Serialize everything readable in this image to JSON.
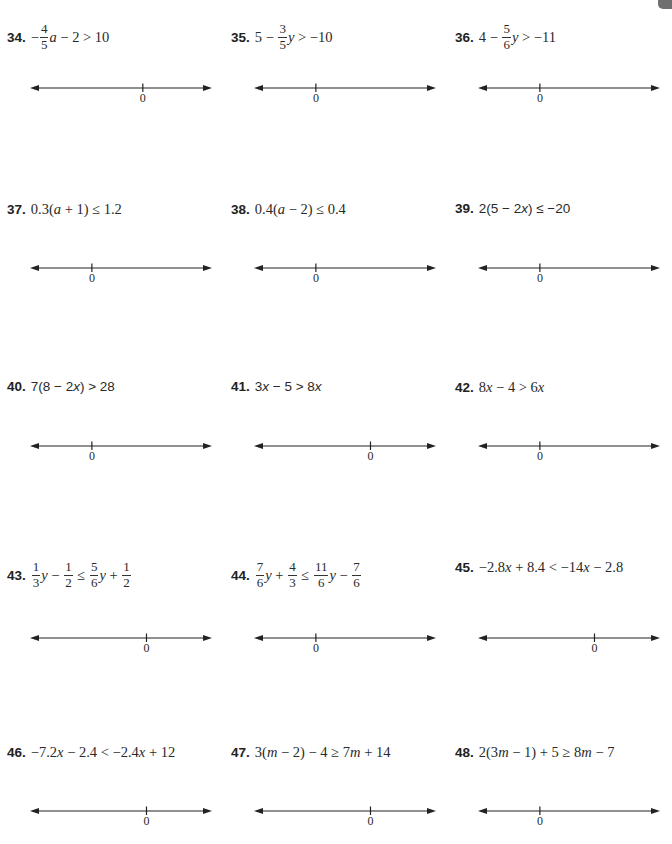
{
  "page": {
    "background": "#ffffff",
    "accent_tab_color": "#6f6f6f"
  },
  "problems": [
    {
      "number": "34.",
      "inequality": "−(4/5)a − 2 > 10",
      "parts": [
        [
          "op",
          "−"
        ],
        [
          "frac",
          "4",
          "5"
        ],
        [
          "var",
          "a"
        ],
        [
          "txt",
          " − 2 > 10"
        ]
      ],
      "zero_label": "0",
      "zero_position_pct": 62
    },
    {
      "number": "35.",
      "inequality": "5 − (3/5)y > −10",
      "parts": [
        [
          "txt",
          "5 − "
        ],
        [
          "frac",
          "3",
          "5"
        ],
        [
          "var",
          "y"
        ],
        [
          "txt",
          " > −10"
        ]
      ],
      "zero_label": "0",
      "zero_position_pct": 34
    },
    {
      "number": "36.",
      "inequality": "4 − (5/6)y > −11",
      "parts": [
        [
          "txt",
          "4 − "
        ],
        [
          "frac",
          "5",
          "6"
        ],
        [
          "var",
          "y"
        ],
        [
          "txt",
          " > −11"
        ]
      ],
      "zero_label": "0",
      "zero_position_pct": 34
    },
    {
      "number": "37.",
      "inequality": "0.3(a + 1) ≤ 1.2",
      "parts": [
        [
          "txt",
          "0.3("
        ],
        [
          "var",
          "a"
        ],
        [
          "txt",
          " + 1) ≤ 1.2"
        ]
      ],
      "zero_label": "0",
      "zero_position_pct": 34
    },
    {
      "number": "38.",
      "inequality": "0.4(a − 2) ≤ 0.4",
      "parts": [
        [
          "txt",
          "0.4("
        ],
        [
          "var",
          "a"
        ],
        [
          "txt",
          " − 2) ≤ 0.4"
        ]
      ],
      "zero_label": "0",
      "zero_position_pct": 34
    },
    {
      "number": "39.",
      "inequality": "2(5 − 2x) ≤ −20",
      "parts": [
        [
          "sans",
          "2(5 − 2"
        ],
        [
          "varsans",
          "x"
        ],
        [
          "sans",
          ") ≤ −20"
        ]
      ],
      "zero_label": "0",
      "zero_position_pct": 34
    },
    {
      "number": "40.",
      "inequality": "7(8 − 2x) > 28",
      "parts": [
        [
          "sans",
          "7(8 − 2"
        ],
        [
          "varsans",
          "x"
        ],
        [
          "sans",
          ") > 28"
        ]
      ],
      "zero_label": "0",
      "zero_position_pct": 34
    },
    {
      "number": "41.",
      "inequality": "3x − 5 > 8x",
      "parts": [
        [
          "sans",
          "3"
        ],
        [
          "varsans",
          "x"
        ],
        [
          "sans",
          " − 5 > 8"
        ],
        [
          "varsans",
          "x"
        ]
      ],
      "zero_label": "0",
      "zero_position_pct": 64
    },
    {
      "number": "42.",
      "inequality": "8x − 4 > 6x",
      "parts": [
        [
          "txt",
          "8"
        ],
        [
          "var",
          "x"
        ],
        [
          "txt",
          " − 4 > 6"
        ],
        [
          "var",
          "x"
        ]
      ],
      "zero_label": "0",
      "zero_position_pct": 34
    },
    {
      "number": "43.",
      "inequality": "(1/3)y − 1/2 ≤ (5/6)y + 1/2",
      "parts": [
        [
          "frac",
          "1",
          "3"
        ],
        [
          "var",
          "y"
        ],
        [
          "txt",
          " − "
        ],
        [
          "frac",
          "1",
          "2"
        ],
        [
          "txt",
          " ≤ "
        ],
        [
          "frac",
          "5",
          "6"
        ],
        [
          "var",
          "y"
        ],
        [
          "txt",
          " + "
        ],
        [
          "frac",
          "1",
          "2"
        ]
      ],
      "zero_label": "0",
      "zero_position_pct": 64
    },
    {
      "number": "44.",
      "inequality": "(7/6)y + 4/3 ≤ (11/6)y − 7/6",
      "parts": [
        [
          "frac",
          "7",
          "6"
        ],
        [
          "var",
          "y"
        ],
        [
          "txt",
          " + "
        ],
        [
          "frac",
          "4",
          "3"
        ],
        [
          "txt",
          " ≤ "
        ],
        [
          "frac",
          "11",
          "6"
        ],
        [
          "var",
          "y"
        ],
        [
          "txt",
          " − "
        ],
        [
          "frac",
          "7",
          "6"
        ]
      ],
      "zero_label": "0",
      "zero_position_pct": 34
    },
    {
      "number": "45.",
      "inequality": "−2.8x + 8.4 < −14x − 2.8",
      "parts": [
        [
          "txt",
          "−2.8"
        ],
        [
          "var",
          "x"
        ],
        [
          "txt",
          " + 8.4 < −14"
        ],
        [
          "var",
          "x"
        ],
        [
          "txt",
          " − 2.8"
        ]
      ],
      "zero_label": "0",
      "zero_position_pct": 64
    },
    {
      "number": "46.",
      "inequality": "−7.2x − 2.4 < −2.4x + 12",
      "parts": [
        [
          "txt",
          "−7.2"
        ],
        [
          "var",
          "x"
        ],
        [
          "txt",
          " − 2.4 < −2.4"
        ],
        [
          "var",
          "x"
        ],
        [
          "txt",
          " + 12"
        ]
      ],
      "zero_label": "0",
      "zero_position_pct": 64
    },
    {
      "number": "47.",
      "inequality": "3(m − 2) − 4 ≥ 7m + 14",
      "parts": [
        [
          "txt",
          "3("
        ],
        [
          "var",
          "m"
        ],
        [
          "txt",
          " − 2) − 4 ≥ 7"
        ],
        [
          "var",
          "m"
        ],
        [
          "txt",
          " + 14"
        ]
      ],
      "zero_label": "0",
      "zero_position_pct": 64
    },
    {
      "number": "48.",
      "inequality": "2(3m − 1) + 5 ≥ 8m − 7",
      "parts": [
        [
          "txt",
          "2(3"
        ],
        [
          "var",
          "m"
        ],
        [
          "txt",
          " − 1) + 5 ≥ 8"
        ],
        [
          "var",
          "m"
        ],
        [
          "txt",
          " − 7"
        ]
      ],
      "zero_label": "0",
      "zero_position_pct": 34
    }
  ]
}
